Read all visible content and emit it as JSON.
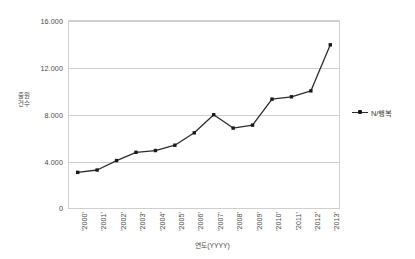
{
  "chart_data": {
    "type": "line",
    "title": "",
    "xlabel": "연도(YYYY)",
    "ylabel": "출원건수",
    "categories": [
      "'2000'",
      "'2001'",
      "'2002'",
      "'2003'",
      "'2004'",
      "'2005'",
      "'2006'",
      "'2007'",
      "'2008'",
      "'2009'",
      "'2010'",
      "'2011'",
      "'2012'",
      "'2013'"
    ],
    "series": [
      {
        "name": "N/행복",
        "values": [
          3100,
          3300,
          4100,
          4800,
          4950,
          5400,
          6450,
          7980,
          6850,
          7100,
          9300,
          9500,
          10000,
          13900
        ]
      }
    ],
    "ylim": [
      0,
      16000
    ],
    "yticks": [
      0,
      4000,
      8000,
      12000,
      16000
    ],
    "ytick_labels": [
      "0",
      "4.000",
      "8.000",
      "12.000",
      "16.000"
    ],
    "grid": true,
    "legend_position": "right",
    "marker": "square",
    "line_color": "#2b2b2b",
    "marker_color": "#1a1a1a",
    "grid_color": "#cfcfcf",
    "frame_color": "#d2d2d2",
    "background": "#ffffff"
  },
  "legend": {
    "entries": [
      {
        "label": "N/행복"
      }
    ]
  }
}
